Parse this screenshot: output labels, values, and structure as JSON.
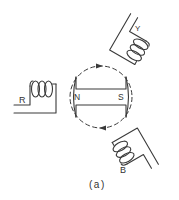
{
  "diagram": {
    "caption": "(a)",
    "rotor": {
      "north_label": "N",
      "south_label": "S",
      "circulation": "clockwise"
    },
    "coils": [
      {
        "id": "coil-r",
        "label": "R",
        "angle_deg": 0
      },
      {
        "id": "coil-y",
        "label": "Y",
        "angle_deg": 120
      },
      {
        "id": "coil-b",
        "label": "B",
        "angle_deg": 240
      }
    ],
    "colors": {
      "line": "#3a3a3a",
      "background": "#ffffff"
    }
  }
}
